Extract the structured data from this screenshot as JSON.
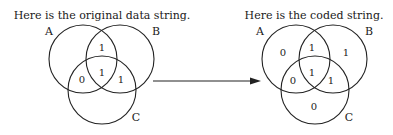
{
  "left": {
    "title": "Here is the original data string.",
    "labels": {
      "a": "A",
      "b": "B",
      "c": "C"
    },
    "regions": {
      "ab": "1",
      "abc": "1",
      "ac": "0",
      "bc": "1"
    }
  },
  "right": {
    "title": "Here is the coded string.",
    "labels": {
      "a": "A",
      "b": "B",
      "c": "C"
    },
    "regions": {
      "a_only": "0",
      "ab": "1",
      "b_only": "1",
      "abc": "1",
      "ac": "0",
      "bc": "1",
      "c_only": "0"
    }
  },
  "arrow": {
    "direction": "right"
  }
}
